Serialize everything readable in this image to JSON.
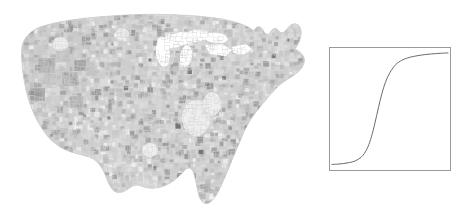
{
  "figure": {
    "background_color": "#ffffff",
    "width": 467,
    "height": 216
  },
  "map": {
    "name": "us-county-choropleth",
    "region": "Contiguous United States",
    "geography_level": "county",
    "projection": "albers-usa",
    "colormap": "grayscale",
    "colors": {
      "lightest": "#f2f2f2",
      "light": "#dcdcdc",
      "mid_light": "#cccccc",
      "mid": "#bdbdbd",
      "mid_dark": "#a8a8a8",
      "dark": "#949494",
      "darkest": "#6f6f6f",
      "border": "#d8d8d8",
      "outline": "#c0c0c0"
    },
    "legend_visible": false,
    "axis_visible": false,
    "labels_visible": false
  },
  "inset": {
    "name": "logistic-curve-inset",
    "frame_color": "#9a9a9a",
    "frame_width": 1,
    "background_color": "#ffffff",
    "position": "right"
  },
  "chart_data": {
    "type": "line",
    "title": "",
    "subtitle": "",
    "xlabel": "",
    "ylabel": "",
    "xlim": [
      0,
      1
    ],
    "ylim": [
      0,
      1
    ],
    "grid": false,
    "legend": false,
    "legend_position": "none",
    "xticks": [],
    "yticks": [],
    "xticklabels": [],
    "yticklabels": [],
    "annotations": [],
    "series": [
      {
        "name": "logistic",
        "color": "#6b6b6b",
        "linewidth": 1,
        "description": "Sigmoid / logistic S-curve, inflection near x=0.38",
        "x": [
          0.0,
          0.05,
          0.1,
          0.15,
          0.2,
          0.25,
          0.28,
          0.31,
          0.34,
          0.37,
          0.4,
          0.43,
          0.46,
          0.5,
          0.55,
          0.6,
          0.65,
          0.7,
          0.75,
          0.8,
          0.85,
          0.9,
          0.95,
          1.0
        ],
        "y": [
          0.03,
          0.033,
          0.038,
          0.046,
          0.06,
          0.09,
          0.125,
          0.18,
          0.265,
          0.38,
          0.51,
          0.63,
          0.725,
          0.81,
          0.877,
          0.912,
          0.932,
          0.945,
          0.954,
          0.961,
          0.966,
          0.97,
          0.973,
          0.975
        ]
      }
    ]
  }
}
